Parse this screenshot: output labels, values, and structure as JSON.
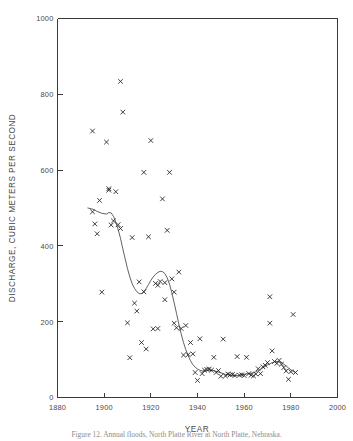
{
  "figure": {
    "caption": "Figure 12. Annual floods, North Platte River at North Platte, Nebraska."
  },
  "chart_data": {
    "type": "scatter",
    "title": "",
    "xlabel": "YEAR",
    "ylabel": "DISCHARGE, CUBIC METERS PER SECOND",
    "xlim": [
      1880,
      2000
    ],
    "ylim": [
      0,
      1000
    ],
    "xticks": [
      1880,
      1900,
      1920,
      1940,
      1960,
      1980,
      2000
    ],
    "xtick_labels": [
      "1880",
      "1900",
      "1920",
      "1940",
      "1960",
      "1980",
      "2000"
    ],
    "yticks": [
      0,
      200,
      400,
      600,
      800,
      1000
    ],
    "ytick_labels": [
      "0",
      "200",
      "400",
      "600",
      "800",
      "1000"
    ],
    "grid": false,
    "legend": null,
    "marker": "x",
    "marker_color": "#1d1d1d",
    "curve_color": "#3a3a3a",
    "series": [
      {
        "name": "Annual peak discharge",
        "marker": "x",
        "points": [
          [
            1895,
            490
          ],
          [
            1895,
            703
          ],
          [
            1896,
            458
          ],
          [
            1897,
            432
          ],
          [
            1898,
            520
          ],
          [
            1899,
            278
          ],
          [
            1901,
            674
          ],
          [
            1902,
            547
          ],
          [
            1902,
            551
          ],
          [
            1903,
            455
          ],
          [
            1904,
            466
          ],
          [
            1905,
            543
          ],
          [
            1906,
            456
          ],
          [
            1907,
            834
          ],
          [
            1907,
            446
          ],
          [
            1908,
            753
          ],
          [
            1910,
            197
          ],
          [
            1911,
            105
          ],
          [
            1912,
            422
          ],
          [
            1913,
            249
          ],
          [
            1914,
            228
          ],
          [
            1915,
            305
          ],
          [
            1916,
            145
          ],
          [
            1917,
            594
          ],
          [
            1917,
            279
          ],
          [
            1918,
            128
          ],
          [
            1919,
            424
          ],
          [
            1920,
            678
          ],
          [
            1921,
            181
          ],
          [
            1922,
            301
          ],
          [
            1923,
            296
          ],
          [
            1923,
            182
          ],
          [
            1924,
            306
          ],
          [
            1925,
            524
          ],
          [
            1926,
            303
          ],
          [
            1926,
            258
          ],
          [
            1927,
            441
          ],
          [
            1928,
            594
          ],
          [
            1929,
            313
          ],
          [
            1930,
            196
          ],
          [
            1930,
            278
          ],
          [
            1931,
            184
          ],
          [
            1932,
            331
          ],
          [
            1933,
            182
          ],
          [
            1934,
            112
          ],
          [
            1935,
            190
          ],
          [
            1936,
            113
          ],
          [
            1937,
            145
          ],
          [
            1938,
            115
          ],
          [
            1939,
            66
          ],
          [
            1940,
            45
          ],
          [
            1941,
            155
          ],
          [
            1942,
            63
          ],
          [
            1943,
            72
          ],
          [
            1944,
            74
          ],
          [
            1945,
            75
          ],
          [
            1946,
            72
          ],
          [
            1947,
            106
          ],
          [
            1948,
            66
          ],
          [
            1949,
            71
          ],
          [
            1950,
            56
          ],
          [
            1951,
            154
          ],
          [
            1952,
            57
          ],
          [
            1953,
            62
          ],
          [
            1954,
            60
          ],
          [
            1955,
            61
          ],
          [
            1956,
            58
          ],
          [
            1957,
            108
          ],
          [
            1958,
            59
          ],
          [
            1959,
            60
          ],
          [
            1960,
            58
          ],
          [
            1961,
            106
          ],
          [
            1962,
            63
          ],
          [
            1963,
            59
          ],
          [
            1964,
            57
          ],
          [
            1965,
            62
          ],
          [
            1966,
            76
          ],
          [
            1967,
            63
          ],
          [
            1968,
            81
          ],
          [
            1969,
            85
          ],
          [
            1970,
            92
          ],
          [
            1971,
            196
          ],
          [
            1971,
            266
          ],
          [
            1972,
            123
          ],
          [
            1973,
            95
          ],
          [
            1974,
            90
          ],
          [
            1975,
            98
          ],
          [
            1976,
            88
          ],
          [
            1977,
            79
          ],
          [
            1978,
            70
          ],
          [
            1979,
            48
          ],
          [
            1980,
            68
          ],
          [
            1981,
            219
          ],
          [
            1982,
            66
          ]
        ]
      }
    ],
    "fit_curve": {
      "name": "Smoothed trend",
      "points": [
        [
          1893,
          500
        ],
        [
          1895,
          497
        ],
        [
          1897,
          491
        ],
        [
          1899,
          486
        ],
        [
          1901,
          484
        ],
        [
          1902,
          488
        ],
        [
          1903,
          487
        ],
        [
          1904,
          478
        ],
        [
          1905,
          462
        ],
        [
          1906,
          443
        ],
        [
          1907,
          420
        ],
        [
          1908,
          392
        ],
        [
          1909,
          366
        ],
        [
          1910,
          340
        ],
        [
          1911,
          318
        ],
        [
          1912,
          300
        ],
        [
          1913,
          288
        ],
        [
          1914,
          279
        ],
        [
          1915,
          274
        ],
        [
          1916,
          274
        ],
        [
          1917,
          279
        ],
        [
          1918,
          288
        ],
        [
          1919,
          298
        ],
        [
          1920,
          309
        ],
        [
          1921,
          318
        ],
        [
          1922,
          325
        ],
        [
          1923,
          330
        ],
        [
          1924,
          333
        ],
        [
          1925,
          332
        ],
        [
          1926,
          327
        ],
        [
          1927,
          316
        ],
        [
          1928,
          299
        ],
        [
          1929,
          276
        ],
        [
          1930,
          250
        ],
        [
          1931,
          222
        ],
        [
          1932,
          194
        ],
        [
          1933,
          168
        ],
        [
          1934,
          145
        ],
        [
          1935,
          126
        ],
        [
          1936,
          110
        ],
        [
          1937,
          97
        ],
        [
          1938,
          87
        ],
        [
          1939,
          80
        ],
        [
          1940,
          75
        ],
        [
          1941,
          72
        ],
        [
          1942,
          70
        ],
        [
          1943,
          70
        ],
        [
          1944,
          71
        ],
        [
          1945,
          72
        ],
        [
          1946,
          72
        ],
        [
          1947,
          71
        ],
        [
          1948,
          69
        ],
        [
          1949,
          67
        ],
        [
          1950,
          65
        ],
        [
          1951,
          63
        ],
        [
          1952,
          61
        ],
        [
          1953,
          60
        ],
        [
          1954,
          59
        ],
        [
          1955,
          58
        ],
        [
          1956,
          58
        ],
        [
          1957,
          58
        ],
        [
          1958,
          59
        ],
        [
          1959,
          60
        ],
        [
          1960,
          61
        ],
        [
          1961,
          62
        ],
        [
          1962,
          63
        ],
        [
          1963,
          64
        ],
        [
          1964,
          66
        ],
        [
          1965,
          68
        ],
        [
          1966,
          71
        ],
        [
          1967,
          74
        ],
        [
          1968,
          78
        ],
        [
          1969,
          82
        ],
        [
          1970,
          86
        ],
        [
          1971,
          89
        ],
        [
          1972,
          92
        ],
        [
          1973,
          94
        ],
        [
          1974,
          95
        ],
        [
          1975,
          94
        ],
        [
          1976,
          92
        ],
        [
          1977,
          88
        ],
        [
          1978,
          83
        ],
        [
          1979,
          78
        ],
        [
          1980,
          73
        ],
        [
          1981,
          69
        ],
        [
          1982,
          66
        ]
      ]
    }
  }
}
